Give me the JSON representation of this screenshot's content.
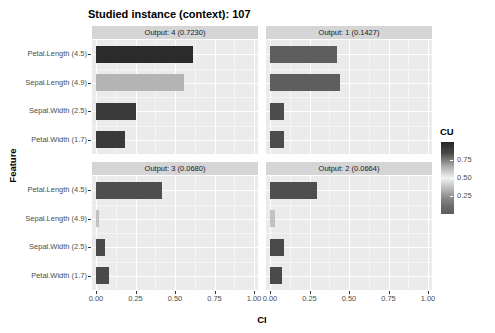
{
  "chart_data": {
    "type": "bar",
    "title": "Studied instance (context): 107",
    "xlabel": "CI",
    "ylabel": "Feature",
    "xlim": [
      0,
      1
    ],
    "xticks": [
      "0.00",
      "0.25",
      "0.50",
      "0.75",
      "1.00"
    ],
    "xtick_values": [
      0.0,
      0.25,
      0.5,
      0.75,
      1.0
    ],
    "grid": true,
    "orientation": "horizontal",
    "categories": [
      "Petal.Length (4.5)",
      "Sepal.Length (4.9)",
      "Sepal.Width (2.5)",
      "Petal.Width (1.7)"
    ],
    "legend": {
      "title": "CU",
      "position": "right",
      "ticks": [
        "0.75",
        "0.50",
        "0.25"
      ],
      "tick_values": [
        0.75,
        0.5,
        0.25
      ],
      "range": [
        0.0,
        1.0
      ],
      "color_low": "#5c5c5c",
      "color_mid": "#f2f2f2",
      "color_high": "#262626"
    },
    "facets": [
      {
        "id": "output-4",
        "label": "Output: 4 (0.7230)",
        "row": 0,
        "col": 0,
        "bars": [
          {
            "category": "Petal.Length (4.5)",
            "ci": 0.615,
            "cu": 0.93,
            "color": "#2b2b2b"
          },
          {
            "category": "Sepal.Length (4.9)",
            "ci": 0.557,
            "cu": 0.52,
            "color": "#b4b4b4"
          },
          {
            "category": "Sepal.Width (2.5)",
            "ci": 0.255,
            "cu": 0.86,
            "color": "#3a3a3a"
          },
          {
            "category": "Petal.Width (1.7)",
            "ci": 0.185,
            "cu": 0.86,
            "color": "#3a3a3a"
          }
        ]
      },
      {
        "id": "output-1",
        "label": "Output: 1 (0.1427)",
        "row": 0,
        "col": 1,
        "bars": [
          {
            "category": "Petal.Length (4.5)",
            "ci": 0.425,
            "cu": 0.74,
            "color": "#5e5e5e"
          },
          {
            "category": "Sepal.Length (4.9)",
            "ci": 0.44,
            "cu": 0.74,
            "color": "#5e5e5e"
          },
          {
            "category": "Sepal.Width (2.5)",
            "ci": 0.09,
            "cu": 0.82,
            "color": "#4c4c4c"
          },
          {
            "category": "Petal.Width (1.7)",
            "ci": 0.09,
            "cu": 0.82,
            "color": "#4c4c4c"
          }
        ]
      },
      {
        "id": "output-3",
        "label": "Output: 3 (0.0680)",
        "row": 1,
        "col": 0,
        "bars": [
          {
            "category": "Petal.Length (4.5)",
            "ci": 0.42,
            "cu": 0.8,
            "color": "#4f4f4f"
          },
          {
            "category": "Sepal.Length (4.9)",
            "ci": 0.02,
            "cu": 0.5,
            "color": "#c2c2c2"
          },
          {
            "category": "Sepal.Width (2.5)",
            "ci": 0.06,
            "cu": 0.83,
            "color": "#4a4a4a"
          },
          {
            "category": "Petal.Width (1.7)",
            "ci": 0.08,
            "cu": 0.83,
            "color": "#4a4a4a"
          }
        ]
      },
      {
        "id": "output-2",
        "label": "Output: 2 (0.0664)",
        "row": 1,
        "col": 1,
        "bars": [
          {
            "category": "Petal.Length (4.5)",
            "ci": 0.3,
            "cu": 0.8,
            "color": "#4f4f4f"
          },
          {
            "category": "Sepal.Length (4.9)",
            "ci": 0.03,
            "cu": 0.5,
            "color": "#c2c2c2"
          },
          {
            "category": "Sepal.Width (2.5)",
            "ci": 0.09,
            "cu": 0.83,
            "color": "#4a4a4a"
          },
          {
            "category": "Petal.Width (1.7)",
            "ci": 0.075,
            "cu": 0.83,
            "color": "#4a4a4a"
          }
        ]
      }
    ]
  }
}
